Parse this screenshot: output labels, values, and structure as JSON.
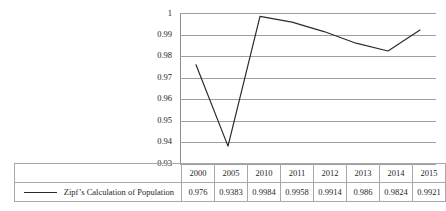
{
  "chart_data": {
    "type": "line",
    "title": "",
    "xlabel": "",
    "ylabel": "",
    "categories": [
      "2000",
      "2005",
      "2010",
      "2011",
      "2012",
      "2013",
      "2014",
      "2015"
    ],
    "series": [
      {
        "name": "Zipf’s Calculation of Population",
        "values": [
          0.976,
          0.9383,
          0.9984,
          0.9958,
          0.9914,
          0.986,
          0.9824,
          0.9921
        ],
        "value_labels": [
          "0.976",
          "0.9383",
          "0.9984",
          "0.9958",
          "0.9914",
          "0.986",
          "0.9824",
          "0.9921"
        ],
        "color": "#2b2b2b"
      }
    ],
    "ylim": [
      0.93,
      1
    ],
    "ytick_labels": [
      "1",
      "0.99",
      "0.98",
      "0.97",
      "0.96",
      "0.95",
      "0.94",
      "0.93"
    ],
    "ytick_values": [
      1,
      0.99,
      0.98,
      0.97,
      0.96,
      0.95,
      0.94,
      0.93
    ],
    "grid": true,
    "grid_color": "#9e9e9e",
    "legend_position": "bottom-table",
    "has_data_table": true
  },
  "data_table": {
    "header_row": [
      "2000",
      "2005",
      "2010",
      "2011",
      "2012",
      "2013",
      "2014",
      "2015"
    ],
    "value_row": [
      "0.976",
      "0.9383",
      "0.9984",
      "0.9958",
      "0.9914",
      "0.986",
      "0.9824",
      "0.9921"
    ],
    "legend_label": "Zipf’s Calculation of Population"
  }
}
